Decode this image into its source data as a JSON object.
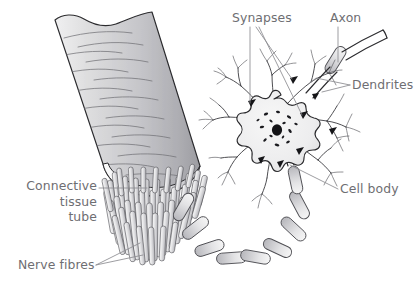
{
  "figure": {
    "background_color": "#ffffff",
    "width": 419,
    "height": 286
  },
  "palette": {
    "label_text": "#6e6e72",
    "leader_line": "#8b8b90",
    "outline": "#2b2b2e",
    "tube_fill_light": "#e8e8ea",
    "tube_fill_mid": "#cfcfd2",
    "tube_fill_dark": "#a8a8ad",
    "fibre_fill_light": "#f2f2f3",
    "fibre_fill_mid": "#c9c9cd",
    "soma_fill": "#efeff0",
    "nucleus_fill": "#141417",
    "nissl_fill": "#1b1b1f",
    "myelin_fill_light": "#ebebec",
    "myelin_fill_mid": "#bcbcc1"
  },
  "labels": [
    {
      "id": "connective-tissue-tube",
      "text_lines": [
        "Connective",
        "tissue",
        "tube"
      ],
      "align": "right",
      "x": 97,
      "y": 190,
      "line_height": 15.5,
      "leader": "M 99,188 L 147,188"
    },
    {
      "id": "nerve-fibres",
      "text_lines": [
        "Nerve fibres"
      ],
      "align": "left",
      "x": 18,
      "y": 269,
      "line_height": 15.5,
      "leader": "M 96,265 L 140,243 M 96,265 L 143,255"
    },
    {
      "id": "synapses",
      "text_lines": [
        "Synapses"
      ],
      "align": "left",
      "x": 232,
      "y": 22,
      "line_height": 15.5,
      "leader": "M 250,27 L 250,103 M 256,27 L 292,79 M 259,27 L 302,115"
    },
    {
      "id": "axon",
      "text_lines": [
        "Axon"
      ],
      "align": "left",
      "x": 330,
      "y": 22,
      "line_height": 15.5,
      "leader": "M 338,27 L 338,62"
    },
    {
      "id": "dendrites",
      "text_lines": [
        "Dendrites"
      ],
      "align": "left",
      "x": 352,
      "y": 89,
      "line_height": 15.5,
      "leader": "M 350,85 L 316,78 L 310,83 M 350,85 L 322,92"
    },
    {
      "id": "cell-body",
      "text_lines": [
        "Cell body"
      ],
      "align": "left",
      "x": 340,
      "y": 193,
      "line_height": 15.5,
      "leader": "M 338,189 L 290,165"
    }
  ],
  "structures": {
    "connective_tissue_tube": {
      "name": "connective-tissue-tube",
      "description": "Cut cylindrical sheath of connective tissue shown in perspective, wavy torn top edge, shaded body with curved surface striations"
    },
    "nerve_fibres": {
      "name": "nerve-fibres",
      "description": "Dense bundle of cylindrical nerve fibres protruding from the elliptical cut end of the tube",
      "count": 58
    },
    "axon": {
      "name": "axon",
      "description": "Long myelinated process; segmented myelin sheath loops from the cut end around and up to the cell body, and continues off to the upper right"
    },
    "cell_body": {
      "name": "cell-body",
      "description": "Star-shaped neuron soma with pale fill, dark round nucleus and scattered Nissl granules"
    },
    "dendrites": {
      "name": "dendrites",
      "description": "Thin branching processes radiating from the cell body"
    },
    "synapses": {
      "name": "synapses",
      "description": "Dark triangular terminal boutons contacting the cell body and dendrites",
      "count": 8
    }
  }
}
